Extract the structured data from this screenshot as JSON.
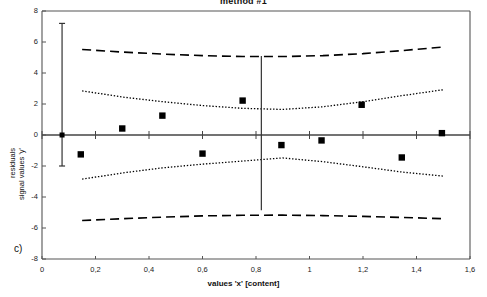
{
  "figure": {
    "title": "method #1",
    "panel_label": "c)",
    "xlabel": "values 'x' [content]",
    "ylabel_line1": "residuals",
    "ylabel_line2": "signal values 'y'"
  },
  "chart_data": {
    "type": "scatter",
    "title": "method #1",
    "xlabel": "values 'x' [content]",
    "ylabel": "residuals signal values 'y'",
    "xlim": [
      0,
      1.6
    ],
    "ylim": [
      -8,
      8
    ],
    "grid": false,
    "legend": "none",
    "xticks": [
      0,
      0.2,
      0.4,
      0.6,
      0.8,
      1.0,
      1.2,
      1.4,
      1.6
    ],
    "xticklabels": [
      "0",
      "0,2",
      "0,4",
      "0,6",
      "0,8",
      "1",
      "1,2",
      "1,4",
      "1,6"
    ],
    "yticks": [
      -8,
      -6,
      -4,
      -2,
      0,
      2,
      4,
      6,
      8
    ],
    "yticklabels": [
      "-8",
      "-6",
      "-4",
      "-2",
      "0",
      "2",
      "4",
      "6",
      "8"
    ],
    "series": [
      {
        "name": "residuals",
        "marker": "filled-square",
        "color": "#000000",
        "x": [
          0.145,
          0.3,
          0.45,
          0.6,
          0.75,
          0.895,
          1.045,
          1.195,
          1.345,
          1.495
        ],
        "y": [
          -1.25,
          0.42,
          1.25,
          -1.2,
          2.22,
          -0.65,
          -0.35,
          1.95,
          -1.45,
          0.12
        ]
      },
      {
        "name": "outer prediction band upper",
        "style": "dashed",
        "color": "#000000",
        "x": [
          0.15,
          0.3,
          0.45,
          0.6,
          0.75,
          0.9,
          1.05,
          1.2,
          1.35,
          1.5
        ],
        "y": [
          5.52,
          5.35,
          5.22,
          5.12,
          5.06,
          5.06,
          5.12,
          5.25,
          5.45,
          5.68
        ]
      },
      {
        "name": "outer prediction band lower",
        "style": "dashed",
        "color": "#000000",
        "x": [
          0.15,
          0.3,
          0.45,
          0.6,
          0.75,
          0.9,
          1.05,
          1.2,
          1.35,
          1.5
        ],
        "y": [
          -5.52,
          -5.4,
          -5.3,
          -5.22,
          -5.18,
          -5.17,
          -5.2,
          -5.25,
          -5.32,
          -5.4
        ]
      },
      {
        "name": "inner confidence band upper",
        "style": "dotted",
        "color": "#000000",
        "x": [
          0.15,
          0.3,
          0.45,
          0.6,
          0.75,
          0.9,
          1.05,
          1.2,
          1.35,
          1.5
        ],
        "y": [
          2.85,
          2.45,
          2.15,
          1.9,
          1.72,
          1.65,
          1.82,
          2.15,
          2.55,
          2.92
        ]
      },
      {
        "name": "inner confidence band lower",
        "style": "dotted",
        "color": "#000000",
        "x": [
          0.15,
          0.3,
          0.45,
          0.6,
          0.75,
          0.9,
          1.05,
          1.2,
          1.35,
          1.5
        ],
        "y": [
          -2.85,
          -2.45,
          -2.12,
          -1.88,
          -1.68,
          -1.48,
          -1.72,
          -2.05,
          -2.4,
          -2.65
        ]
      }
    ],
    "annotations": [
      {
        "name": "error-bar-left",
        "type": "vertical-error-bar",
        "x": 0.075,
        "y_center": 0.0,
        "y_top": 7.2,
        "y_bottom": -2.0,
        "marker": "filled-square"
      },
      {
        "name": "vertical-range-line-center",
        "type": "vertical-line",
        "x": 0.82,
        "y_top": 5.1,
        "y_bottom": -4.85
      }
    ]
  }
}
